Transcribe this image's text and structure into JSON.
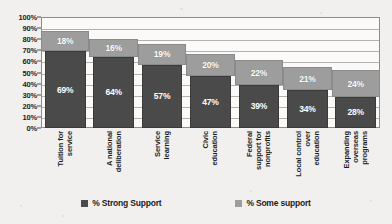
{
  "chart_data": {
    "type": "bar",
    "subtype": "stacked-bar",
    "title": "",
    "xlabel": "",
    "ylabel": "",
    "ylim": [
      0,
      100
    ],
    "grid": true,
    "legend_position": "bottom",
    "categories": [
      "Tuition for service",
      "A national deliberation",
      "Service learning",
      "Civic education",
      "Federal support for nonprofits",
      "Local control over education",
      "Expanding overseas programs"
    ],
    "category_lines": [
      [
        "Tuition for",
        "service"
      ],
      [
        "A national",
        "deliberation"
      ],
      [
        "Service",
        "learning"
      ],
      [
        "Civic",
        "education"
      ],
      [
        "Federal",
        "support for",
        "nonprofits"
      ],
      [
        "Local control",
        "over",
        "education"
      ],
      [
        "Expanding",
        "overseas",
        "programs"
      ]
    ],
    "series": [
      {
        "name": "% Strong Support",
        "color": "#4a4a4a",
        "values": [
          69,
          64,
          57,
          47,
          39,
          34,
          28
        ],
        "labels": [
          "69%",
          "64%",
          "57%",
          "47%",
          "39%",
          "34%",
          "28%"
        ]
      },
      {
        "name": "% Some support",
        "color": "#9d9d9d",
        "values": [
          18,
          16,
          19,
          20,
          22,
          21,
          24
        ],
        "labels": [
          "18%",
          "16%",
          "19%",
          "20%",
          "22%",
          "21%",
          "24%"
        ]
      }
    ],
    "y_ticks": [
      {
        "value": 100,
        "label": "100%"
      },
      {
        "value": 90,
        "label": "90%"
      },
      {
        "value": 80,
        "label": "80%"
      },
      {
        "value": 70,
        "label": "70%"
      },
      {
        "value": 60,
        "label": "60%"
      },
      {
        "value": 50,
        "label": "50%"
      },
      {
        "value": 40,
        "label": "40%"
      },
      {
        "value": 30,
        "label": "30%"
      },
      {
        "value": 20,
        "label": "20%"
      },
      {
        "value": 10,
        "label": "10%"
      },
      {
        "value": 0,
        "label": "0%"
      }
    ]
  },
  "legend": {
    "items": [
      {
        "label": "% Strong Support",
        "color": "#4a4a4a",
        "swatch": "square-dark-icon"
      },
      {
        "label": "% Some support",
        "color": "#9d9d9d",
        "swatch": "square-light-icon"
      }
    ]
  }
}
